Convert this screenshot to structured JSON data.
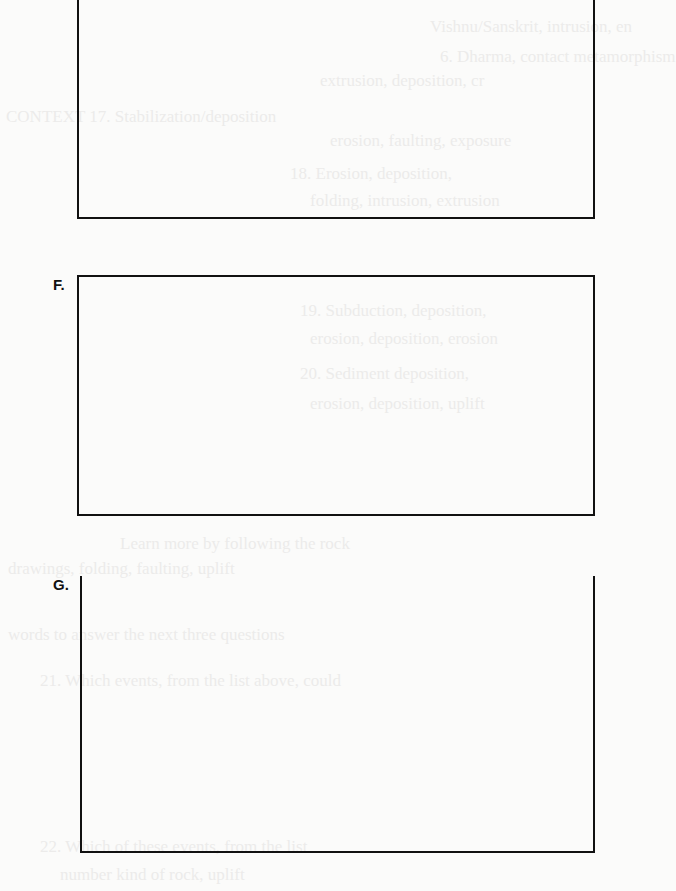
{
  "page": {
    "background": "#fbfbfa",
    "ink": "#111111"
  },
  "boxes": [
    {
      "label": "",
      "id": "E"
    },
    {
      "label": "F.",
      "id": "F"
    },
    {
      "label": "G.",
      "id": "G"
    }
  ],
  "bleed_through_text": [
    "Vishnu/Sanskrit, intrusion, en",
    "6. Dharma, contact metamorphism",
    "extrusion, deposition, cr",
    "CONTEXT 17. Stabilization/deposition",
    "erosion, faulting, exposure",
    "18. Erosion, deposition,",
    "folding, intrusion, extrusion",
    "19. Subduction, deposition,",
    "erosion, deposition, erosion",
    "20. Sediment deposition,",
    "erosion, deposition, uplift",
    "Learn more by following the rock",
    "drawings, folding, faulting, uplift",
    "words to answer the next three questions",
    "21. Which events, from the list above, could",
    "22. Which of these events, from the list",
    "number kind of rock, uplift"
  ]
}
